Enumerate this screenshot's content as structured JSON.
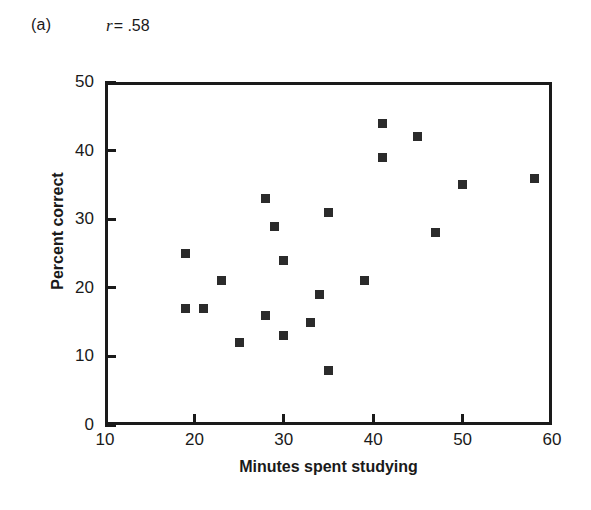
{
  "figure": {
    "panel_label": "(a)",
    "annotation_symbol": "r",
    "annotation_value": "= .58",
    "marker_color": "#2b2b2b",
    "axis_color": "#1a1a1a",
    "background": "#ffffff"
  },
  "chart_data": {
    "type": "scatter",
    "title": "",
    "subtitle": "",
    "xlabel": "Minutes spent studying",
    "ylabel": "Percent correct",
    "xlim": [
      10,
      60
    ],
    "ylim": [
      0,
      50
    ],
    "xticks": [
      10,
      20,
      30,
      40,
      50,
      60
    ],
    "yticks": [
      0,
      10,
      20,
      30,
      40,
      50
    ],
    "xtick_labels": [
      "10",
      "20",
      "30",
      "40",
      "50",
      "60"
    ],
    "ytick_labels": [
      "0",
      "10",
      "20",
      "30",
      "40",
      "50"
    ],
    "grid": false,
    "legend": false,
    "annotations": [
      {
        "text": "(a)",
        "role": "panel-label"
      },
      {
        "text": "r = .58",
        "role": "correlation-coefficient"
      }
    ],
    "correlation_r": 0.58,
    "n_points": 21,
    "points": [
      {
        "x": 19,
        "y": 25
      },
      {
        "x": 19,
        "y": 17
      },
      {
        "x": 21,
        "y": 17
      },
      {
        "x": 23,
        "y": 21
      },
      {
        "x": 25,
        "y": 12
      },
      {
        "x": 28,
        "y": 33
      },
      {
        "x": 28,
        "y": 16
      },
      {
        "x": 29,
        "y": 29
      },
      {
        "x": 30,
        "y": 24
      },
      {
        "x": 30,
        "y": 13
      },
      {
        "x": 33,
        "y": 15
      },
      {
        "x": 34,
        "y": 19
      },
      {
        "x": 35,
        "y": 31
      },
      {
        "x": 35,
        "y": 8
      },
      {
        "x": 39,
        "y": 21
      },
      {
        "x": 41,
        "y": 44
      },
      {
        "x": 41,
        "y": 39
      },
      {
        "x": 45,
        "y": 42
      },
      {
        "x": 47,
        "y": 28
      },
      {
        "x": 50,
        "y": 35
      },
      {
        "x": 58,
        "y": 36
      }
    ]
  }
}
